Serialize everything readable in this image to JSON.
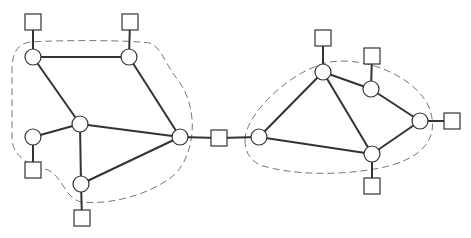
{
  "diagram": {
    "type": "network-topology",
    "colors": {
      "line": "#333333",
      "boundary": "#777777",
      "fill": "#ffffff"
    },
    "domains": [
      {
        "id": "left",
        "routers": [
          "A",
          "B",
          "C",
          "D",
          "E",
          "F"
        ],
        "boundary_path": "M30,42 C18,44 12,52 12,70 L12,140 C14,158 30,165 48,170 C62,176 66,200 82,202 C110,205 150,195 174,175 C195,155 200,110 178,80 C166,66 162,48 150,43 C130,40 60,40 30,42 Z"
      },
      {
        "id": "right",
        "routers": [
          "G",
          "H",
          "I",
          "J",
          "K"
        ],
        "boundary_path": "M245,140 C245,115 290,70 330,62 C370,56 420,80 430,110 C440,140 420,160 380,168 C340,176 290,175 260,165 C250,160 245,152 245,140 Z"
      }
    ],
    "routers": [
      {
        "id": "A",
        "x": 33,
        "y": 57
      },
      {
        "id": "B",
        "x": 129,
        "y": 57
      },
      {
        "id": "C",
        "x": 80,
        "y": 124
      },
      {
        "id": "D",
        "x": 33,
        "y": 137
      },
      {
        "id": "E",
        "x": 81,
        "y": 184
      },
      {
        "id": "F",
        "x": 180,
        "y": 137
      },
      {
        "id": "G",
        "x": 259,
        "y": 137
      },
      {
        "id": "H",
        "x": 323,
        "y": 72
      },
      {
        "id": "I",
        "x": 371,
        "y": 89
      },
      {
        "id": "J",
        "x": 420,
        "y": 121
      },
      {
        "id": "K",
        "x": 372,
        "y": 154
      }
    ],
    "hosts": [
      {
        "id": "hA",
        "x": 33,
        "y": 22,
        "attached_to": "A"
      },
      {
        "id": "hB",
        "x": 130,
        "y": 22,
        "attached_to": "B"
      },
      {
        "id": "hD",
        "x": 33,
        "y": 170,
        "attached_to": "D"
      },
      {
        "id": "hE",
        "x": 82,
        "y": 218,
        "attached_to": "E"
      },
      {
        "id": "hBridge",
        "x": 219,
        "y": 138,
        "attached_to": "F,G"
      },
      {
        "id": "hH",
        "x": 323,
        "y": 38,
        "attached_to": "H"
      },
      {
        "id": "hI",
        "x": 372,
        "y": 56,
        "attached_to": "I"
      },
      {
        "id": "hJ",
        "x": 452,
        "y": 121,
        "attached_to": "J"
      },
      {
        "id": "hK",
        "x": 372,
        "y": 186,
        "attached_to": "K"
      }
    ],
    "links": [
      [
        "A",
        "B"
      ],
      [
        "A",
        "C"
      ],
      [
        "B",
        "F"
      ],
      [
        "C",
        "D"
      ],
      [
        "C",
        "E"
      ],
      [
        "C",
        "F"
      ],
      [
        "E",
        "F"
      ],
      [
        "G",
        "H"
      ],
      [
        "G",
        "K"
      ],
      [
        "H",
        "I"
      ],
      [
        "H",
        "K"
      ],
      [
        "I",
        "J"
      ],
      [
        "J",
        "K"
      ]
    ]
  }
}
